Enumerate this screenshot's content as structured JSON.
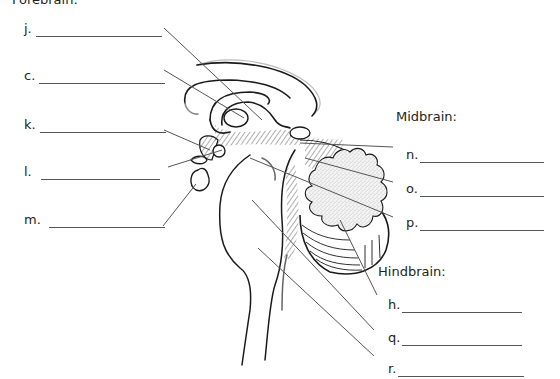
{
  "sections": {
    "forebrain": {
      "title": "Forebrain:"
    },
    "midbrain": {
      "title": "Midbrain:"
    },
    "hindbrain": {
      "title": "Hindbrain:"
    }
  },
  "labels": {
    "forebrain": [
      {
        "letter": "j.",
        "answer": ""
      },
      {
        "letter": "c.",
        "answer": ""
      },
      {
        "letter": "k.",
        "answer": ""
      },
      {
        "letter": "l.",
        "answer": ""
      },
      {
        "letter": "m.",
        "answer": ""
      }
    ],
    "midbrain": [
      {
        "letter": "n.",
        "answer": ""
      },
      {
        "letter": "o.",
        "answer": ""
      },
      {
        "letter": "p.",
        "answer": ""
      }
    ],
    "hindbrain": [
      {
        "letter": "h.",
        "answer": ""
      },
      {
        "letter": "q.",
        "answer": ""
      },
      {
        "letter": "r.",
        "answer": ""
      }
    ]
  },
  "colors": {
    "text": "#231f20",
    "line": "#555555",
    "ink": "#1a1a1a",
    "stipple": "#d9d9d9"
  }
}
